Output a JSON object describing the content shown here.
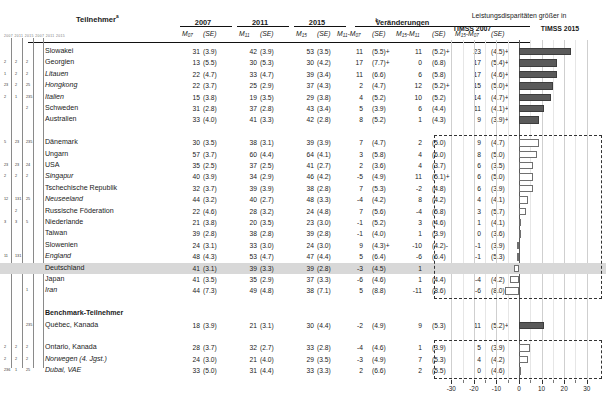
{
  "table": {
    "col_title": "Teilnehmer",
    "col_title_sup": "a",
    "year_headers": [
      "2007",
      "2011",
      "2015"
    ],
    "change_header": "Veränderungen",
    "change_header_sup": "b",
    "sub_headers": [
      {
        "m": "M",
        "sub": "07",
        "se": "(SE)"
      },
      {
        "m": "M",
        "sub": "11",
        "se": "(SE)"
      },
      {
        "m": "M",
        "sub": "15",
        "se": "(SE)"
      },
      {
        "m": "M",
        "sub": "11",
        "m2": "M",
        "sub2": "07",
        "se": "(SE)"
      },
      {
        "m": "M",
        "sub": "15",
        "m2": "M",
        "sub2": "11",
        "se": "(SE)"
      },
      {
        "m": "M",
        "sub": "15",
        "m2": "M",
        "sub2": "07",
        "se": "(SE)"
      }
    ],
    "sub_header_labels": [
      "M07 (SE)",
      "M11 (SE)",
      "M15 (SE)",
      "M11-M07 (SE)",
      "M15-M11 (SE)",
      "M15-M07 (SE)"
    ],
    "benchmark_label": "Benchmark-Teilnehmer",
    "rows": [
      {
        "name": "Slowakei",
        "italic": false,
        "fn": [
          "",
          "",
          ""
        ],
        "m07": "31",
        "se07": "(3.9)",
        "m11": "42",
        "se11": "(3.9)",
        "m15": "53",
        "se15": "(3.5)",
        "d1": "11",
        "sd1": "(5.5)+",
        "d2": "11",
        "sd2": "(5.2)+",
        "d3": "23",
        "sd3": "(4.5)+",
        "bar": 23,
        "filled": true
      },
      {
        "name": "Georgien",
        "italic": false,
        "fn": [
          "2",
          "2",
          "2"
        ],
        "m07": "13",
        "se07": "(5.5)",
        "m11": "30",
        "se11": "(5.3)",
        "m15": "30",
        "se15": "(4.2)",
        "d1": "17",
        "sd1": "(7.7)+",
        "d2": "0",
        "sd2": "(6.8)",
        "d3": "17",
        "sd3": "(5.4)+",
        "bar": 17,
        "filled": true
      },
      {
        "name": "Litauen",
        "italic": true,
        "fn": [
          "1",
          "2",
          "2"
        ],
        "m07": "22",
        "se07": "(4.7)",
        "m11": "33",
        "se11": "(4.7)",
        "m15": "39",
        "se15": "(3.4)",
        "d1": "11",
        "sd1": "(6.6)",
        "d2": "6",
        "sd2": "(5.8)",
        "d3": "17",
        "sd3": "(4.6)+",
        "bar": 17,
        "filled": true
      },
      {
        "name": "Hongkong",
        "italic": true,
        "fn": [
          "23",
          "2",
          "25"
        ],
        "m07": "22",
        "se07": "(3.7)",
        "m11": "25",
        "se11": "(2.9)",
        "m15": "37",
        "se15": "(4.3)",
        "d1": "2",
        "sd1": "(4.7)",
        "d2": "12",
        "sd2": "(5.2)+",
        "d3": "15",
        "sd3": "(5.0)+",
        "bar": 15,
        "filled": true
      },
      {
        "name": "Italien",
        "italic": true,
        "fn": [
          "2",
          "1",
          "235"
        ],
        "m07": "15",
        "se07": "(3.8)",
        "m11": "19",
        "se11": "(3.5)",
        "m15": "29",
        "se15": "(3.8)",
        "d1": "4",
        "sd1": "(5.2)",
        "d2": "10",
        "sd2": "(5.2)",
        "d3": "14",
        "sd3": "(4.7)+",
        "bar": 14,
        "filled": true
      },
      {
        "name": "Schweden",
        "italic": false,
        "fn": [
          "",
          "",
          "2"
        ],
        "m07": "31",
        "se07": "(2.8)",
        "m11": "37",
        "se11": "(2.8)",
        "m15": "43",
        "se15": "(3.4)",
        "d1": "5",
        "sd1": "(3.9)",
        "d2": "6",
        "sd2": "(4.4)",
        "d3": "11",
        "sd3": "(4.1)+",
        "bar": 11,
        "filled": true
      },
      {
        "name": "Australien",
        "italic": false,
        "fn": [
          "",
          "",
          ""
        ],
        "m07": "33",
        "se07": "(4.0)",
        "m11": "41",
        "se11": "(3.3)",
        "m15": "42",
        "se15": "(2.8)",
        "d1": "8",
        "sd1": "(5.2)",
        "d2": "1",
        "sd2": "(4.3)",
        "d3": "9",
        "sd3": "(3.9)+",
        "bar": 9,
        "filled": true
      },
      {
        "name": "Dänemark",
        "italic": false,
        "fn": [
          "5",
          "23",
          "235"
        ],
        "m07": "30",
        "se07": "(3.5)",
        "m11": "38",
        "se11": "(3.1)",
        "m15": "39",
        "se15": "(3.9)",
        "d1": "7",
        "sd1": "(4.7)",
        "d2": "2",
        "sd2": "(5.0)",
        "d3": "9",
        "sd3": "(4.7)",
        "bar": 9,
        "filled": false
      },
      {
        "name": "Ungarn",
        "italic": false,
        "fn": [
          "",
          "",
          ""
        ],
        "m07": "57",
        "se07": "(3.7)",
        "m11": "60",
        "se11": "(4.4)",
        "m15": "64",
        "se15": "(4.1)",
        "d1": "3",
        "sd1": "(5.8)",
        "d2": "4",
        "sd2": "(6.0)",
        "d3": "8",
        "sd3": "(5.0)",
        "bar": 8,
        "filled": false
      },
      {
        "name": "USA",
        "italic": false,
        "fn": [
          "23",
          "23",
          "24"
        ],
        "m07": "35",
        "se07": "(2.5)",
        "m11": "37",
        "se11": "(2.5)",
        "m15": "41",
        "se15": "(2.7)",
        "d1": "2",
        "sd1": "(3.6)",
        "d2": "4",
        "sd2": "(3.7)",
        "d3": "6",
        "sd3": "(3.5)",
        "bar": 6,
        "filled": false
      },
      {
        "name": "Singapur",
        "italic": true,
        "fn": [
          "2",
          "2",
          "2"
        ],
        "m07": "40",
        "se07": "(3.9)",
        "m11": "34",
        "se11": "(2.9)",
        "m15": "46",
        "se15": "(4.2)",
        "d1": "-5",
        "sd1": "(4.9)",
        "d2": "11",
        "sd2": "(5.1)+",
        "d3": "6",
        "sd3": "(5.0)",
        "bar": 6,
        "filled": false
      },
      {
        "name": "Tschechische Republik",
        "italic": false,
        "fn": [
          "",
          "",
          ""
        ],
        "m07": "32",
        "se07": "(3.7)",
        "m11": "39",
        "se11": "(3.9)",
        "m15": "38",
        "se15": "(2.8)",
        "d1": "7",
        "sd1": "(5.3)",
        "d2": "-2",
        "sd2": "(4.8)",
        "d3": "6",
        "sd3": "(3.9)",
        "bar": 6,
        "filled": false
      },
      {
        "name": "Neuseeland",
        "italic": true,
        "fn": [
          "12",
          "131",
          "25"
        ],
        "m07": "44",
        "se07": "(3.2)",
        "m11": "40",
        "se11": "(2.7)",
        "m15": "48",
        "se15": "(3.3)",
        "d1": "-4",
        "sd1": "(4.2)",
        "d2": "8",
        "sd2": "(4.2)",
        "d3": "4",
        "sd3": "(4.1)",
        "bar": 4,
        "filled": false
      },
      {
        "name": "Russische Föderation",
        "italic": false,
        "fn": [
          "",
          "2",
          ""
        ],
        "m07": "22",
        "se07": "(4.6)",
        "m11": "28",
        "se11": "(3.2)",
        "m15": "24",
        "se15": "(4.8)",
        "d1": "7",
        "sd1": "(5.6)",
        "d2": "-4",
        "sd2": "(5.8)",
        "d3": "3",
        "sd3": "(5.7)",
        "bar": 3,
        "filled": false
      },
      {
        "name": "Niederlande",
        "italic": false,
        "fn": [
          "3",
          "3",
          "5"
        ],
        "m07": "21",
        "se07": "(3.8)",
        "m11": "20",
        "se11": "(3.5)",
        "m15": "23",
        "se15": "(3.0)",
        "d1": "-1",
        "sd1": "(5.2)",
        "d2": "3",
        "sd2": "(4.6)",
        "d3": "1",
        "sd3": "(4.1)",
        "bar": 1,
        "filled": false
      },
      {
        "name": "Taiwan",
        "italic": false,
        "fn": [
          "",
          "",
          ""
        ],
        "m07": "39",
        "se07": "(2.8)",
        "m11": "38",
        "se11": "(2.8)",
        "m15": "39",
        "se15": "(2.8)",
        "d1": "-1",
        "sd1": "(4.0)",
        "d2": "1",
        "sd2": "(3.9)",
        "d3": "0",
        "sd3": "(3.6)",
        "bar": 0,
        "filled": false
      },
      {
        "name": "Slowenien",
        "italic": false,
        "fn": [
          "",
          "",
          ""
        ],
        "m07": "24",
        "se07": "(3.1)",
        "m11": "33",
        "se11": "(3.0)",
        "m15": "24",
        "se15": "(3.0)",
        "d1": "9",
        "sd1": "(4.3)+",
        "d2": "-10",
        "sd2": "(4.2)-",
        "d3": "-1",
        "sd3": "(3.9)",
        "bar": -1,
        "filled": false
      },
      {
        "name": "England",
        "italic": true,
        "fn": [
          "11",
          "131",
          ""
        ],
        "m07": "48",
        "se07": "(4.3)",
        "m11": "53",
        "se11": "(4.7)",
        "m15": "47",
        "se15": "(4.4)",
        "d1": "5",
        "sd1": "(6.4)",
        "d2": "-6",
        "sd2": "(6.4)",
        "d3": "-1",
        "sd3": "(5.3)",
        "bar": -1,
        "filled": false
      },
      {
        "name": "Deutschland",
        "italic": false,
        "highlight": true,
        "fn": [
          "",
          "",
          ""
        ],
        "m07": "41",
        "se07": "(3.1)",
        "m11": "39",
        "se11": "(3.3)",
        "m15": "39",
        "se15": "(2.8)",
        "d1": "-3",
        "sd1": "(4.5)",
        "d2": "1",
        "sd2": "(4.3)",
        "d3": "-2",
        "sd3": "(3.7)",
        "bar": -2,
        "filled": false
      },
      {
        "name": "Japan",
        "italic": false,
        "fn": [
          "",
          "",
          ""
        ],
        "m07": "41",
        "se07": "(3.5)",
        "m11": "35",
        "se11": "(2.9)",
        "m15": "37",
        "se15": "(3.3)",
        "d1": "-6",
        "sd1": "(4.6)",
        "d2": "1",
        "sd2": "(4.4)",
        "d3": "-4",
        "sd3": "(4.2)",
        "bar": -4,
        "filled": false
      },
      {
        "name": "Iran",
        "italic": true,
        "fn": [
          "",
          "",
          "1"
        ],
        "m07": "44",
        "se07": "(7.3)",
        "m11": "49",
        "se11": "(4.8)",
        "m15": "38",
        "se15": "(7.1)",
        "d1": "5",
        "sd1": "(8.8)",
        "d2": "-11",
        "sd2": "(8.6)",
        "d3": "-6",
        "sd3": "(8.0)",
        "bar": -6,
        "filled": false
      },
      {
        "name": "Benchmark-Teilnehmer",
        "bold": true,
        "section": true
      },
      {
        "name": "Québec, Kanada",
        "italic": false,
        "nameitalic2": "Kanada",
        "fn": [
          "",
          "",
          "235"
        ],
        "m07": "18",
        "se07": "(3.9)",
        "m11": "21",
        "se11": "(3.1)",
        "m15": "30",
        "se15": "(4.4)",
        "d1": "-2",
        "sd1": "(4.9)",
        "d2": "9",
        "sd2": "(5.3)",
        "d3": "11",
        "sd3": "(5.2)+",
        "bar": 11,
        "filled": true
      },
      {
        "name": "Ontario, Kanada",
        "italic": false,
        "fn": [
          "2",
          "2",
          "2"
        ],
        "m07": "28",
        "se07": "(3.7)",
        "m11": "32",
        "se11": "(2.7)",
        "m15": "33",
        "se15": "(2.8)",
        "d1": "-4",
        "sd1": "(4.6)",
        "d2": "1",
        "sd2": "(3.9)",
        "d3": "5",
        "sd3": "(3.9)",
        "bar": 5,
        "filled": false
      },
      {
        "name": "Norwegen (4. Jgst.)",
        "italic": true,
        "fn": [
          "2",
          "2",
          "2"
        ],
        "m07": "24",
        "se07": "(3.0)",
        "m11": "21",
        "se11": "(4.0)",
        "m15": "29",
        "se15": "(3.5)",
        "d1": "-3",
        "sd1": "(4.9)",
        "d2": "7",
        "sd2": "(5.3)",
        "d3": "4",
        "sd3": "(4.2)",
        "bar": 4,
        "filled": false
      },
      {
        "name": "Dubai, VAE",
        "italic": true,
        "fn": [
          "236",
          "1",
          "25"
        ],
        "m07": "33",
        "se07": "(5.0)",
        "m11": "31",
        "se11": "(4.4)",
        "m15": "33",
        "se15": "(3.3)",
        "d1": "2",
        "sd1": "(6.6)",
        "d2": "2",
        "sd2": "(5.5)",
        "d3": "0",
        "sd3": "(4.6)",
        "bar": 0,
        "filled": false
      }
    ]
  },
  "chart_data": {
    "type": "bar",
    "title_line1": "Leistungsdisparitäten größer in",
    "title_left": "TIMSS 2007",
    "title_right": "TIMSS 2015",
    "xlabel": "",
    "ylabel": "",
    "xlim": [
      -35,
      35
    ],
    "xticks": [
      -30,
      -20,
      -10,
      0,
      10,
      20,
      30
    ],
    "xtick_labels": [
      "-30",
      "-20",
      "-10",
      "0",
      "10",
      "20",
      "30"
    ],
    "grid": true,
    "legend_fill_label": "signifikant",
    "categories": [
      "Slowakei",
      "Georgien",
      "Litauen",
      "Hongkong",
      "Italien",
      "Schweden",
      "Australien",
      "Dänemark",
      "Ungarn",
      "USA",
      "Singapur",
      "Tschechische Republik",
      "Neuseeland",
      "Russische Föderation",
      "Niederlande",
      "Taiwan",
      "Slowenien",
      "England",
      "Deutschland",
      "Japan",
      "Iran",
      "Québec, Kanada",
      "Ontario, Kanada",
      "Norwegen (4. Jgst.)",
      "Dubai, VAE"
    ],
    "values": [
      23,
      17,
      17,
      15,
      14,
      11,
      9,
      9,
      8,
      6,
      6,
      6,
      4,
      3,
      1,
      0,
      -1,
      -1,
      -2,
      -4,
      -6,
      11,
      5,
      4,
      0
    ],
    "significant": [
      true,
      true,
      true,
      true,
      true,
      true,
      true,
      false,
      false,
      false,
      false,
      false,
      false,
      false,
      false,
      false,
      false,
      false,
      false,
      false,
      false,
      true,
      false,
      false,
      false
    ]
  }
}
